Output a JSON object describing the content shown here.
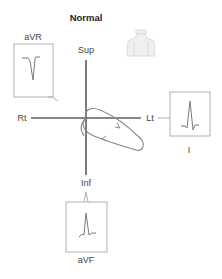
{
  "title": "Normal",
  "axes": {
    "superior_label": "Sup",
    "inferior_label": "Inf",
    "right_label": "Rt",
    "left_label": "Lt"
  },
  "leads": [
    {
      "id": "aVR",
      "label": "aVR",
      "deflection": "negative"
    },
    {
      "id": "I",
      "label": "I",
      "deflection": "positive"
    },
    {
      "id": "aVF",
      "label": "aVF",
      "deflection": "positive"
    }
  ],
  "loop": {
    "description": "frontal plane QRS vector loop",
    "direction": "counterclockwise"
  },
  "figure": {
    "icon": "torso-icon"
  },
  "colors": {
    "axis": "#111111",
    "loop": "#8a8a8a",
    "box": "#a8a8a8",
    "trace": "#7a7a7a",
    "torso": "#dcdcdc"
  }
}
